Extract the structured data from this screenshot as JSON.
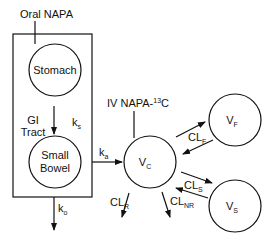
{
  "diagram": {
    "oral_dose_label": "Oral NAPA",
    "iv_dose_label": "IV NAPA-",
    "iv_dose_isotope_sup": "13",
    "iv_dose_isotope_elem": "C",
    "stomach_label": "Stomach",
    "gi_tract_label_line1": "GI",
    "gi_tract_label_line2": "Tract",
    "k_s": {
      "base": "k",
      "sub": "s"
    },
    "small_bowel_line1": "Small",
    "small_bowel_line2": "Bowel",
    "k_a": {
      "base": "k",
      "sub": "a"
    },
    "k_o": {
      "base": "k",
      "sub": "o"
    },
    "v_c": {
      "base": "V",
      "sub": "C"
    },
    "v_f": {
      "base": "V",
      "sub": "F"
    },
    "v_s": {
      "base": "V",
      "sub": "S"
    },
    "cl_f": {
      "base": "CL",
      "sub": "F"
    },
    "cl_s": {
      "base": "CL",
      "sub": "S"
    },
    "cl_r": {
      "base": "CL",
      "sub": "R"
    },
    "cl_nr": {
      "base": "CL",
      "sub": "NR"
    }
  }
}
